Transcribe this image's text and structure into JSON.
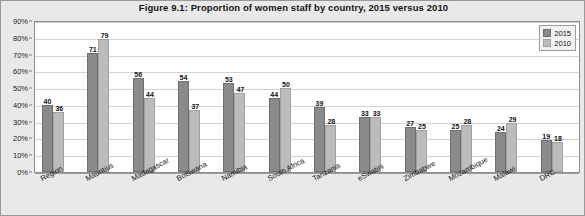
{
  "chart_data": {
    "type": "bar",
    "title": "Figure 9.1: Proportion of women staff by country, 2015 versus 2010",
    "xlabel": "",
    "ylabel": "",
    "ylim": [
      0,
      90
    ],
    "ytick_values": [
      90,
      80,
      70,
      60,
      50,
      40,
      30,
      20,
      10,
      0
    ],
    "ytick_labels": [
      "90%",
      "80%",
      "70%",
      "60%",
      "50%",
      "40%",
      "30%",
      "20%",
      "10%",
      "0%"
    ],
    "grid": true,
    "legend_position": "top-right",
    "categories": [
      "Region",
      "Mauritius",
      "Madagascar",
      "Botswana",
      "Namibia",
      "South Africa",
      "Tanzania",
      "eSwatini",
      "Zimbabwe",
      "Mozambique",
      "Malawi",
      "DRC"
    ],
    "series": [
      {
        "name": "2015",
        "color": "#8a8a8a",
        "values": [
          40,
          71,
          56,
          54,
          53,
          44,
          39,
          33,
          27,
          25,
          24,
          19
        ]
      },
      {
        "name": "2010",
        "color": "#bcbcbc",
        "values": [
          36,
          79,
          44,
          37,
          47,
          50,
          28,
          33,
          25,
          28,
          29,
          18
        ]
      }
    ]
  }
}
